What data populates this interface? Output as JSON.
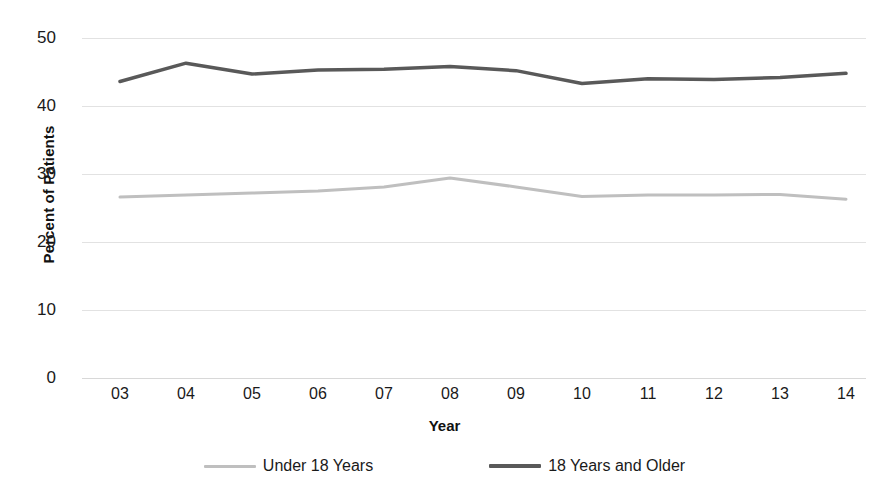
{
  "chart_data": {
    "type": "line",
    "title": "",
    "xlabel": "Year",
    "ylabel": "Percent of Patients",
    "categories": [
      "03",
      "04",
      "05",
      "06",
      "07",
      "08",
      "09",
      "10",
      "11",
      "12",
      "13",
      "14"
    ],
    "ylim": [
      0,
      50
    ],
    "yticks": [
      0,
      10,
      20,
      30,
      40,
      50
    ],
    "grid": true,
    "legend_position": "bottom",
    "series": [
      {
        "name": "Under 18 Years",
        "color": "#bfbfbf",
        "values": [
          26.6,
          26.9,
          27.2,
          27.5,
          28.1,
          29.4,
          28.1,
          26.7,
          26.9,
          26.9,
          27.0,
          26.3
        ]
      },
      {
        "name": "18 Years and Older",
        "color": "#595959",
        "values": [
          43.6,
          46.3,
          44.7,
          45.3,
          45.4,
          45.8,
          45.2,
          43.3,
          44.0,
          43.9,
          44.2,
          44.8
        ]
      }
    ]
  },
  "axes": {
    "y_title": "Percent of Patients",
    "x_title": "Year",
    "y_tick_labels": [
      "50",
      "40",
      "30",
      "20",
      "10",
      "0"
    ],
    "x_tick_labels": [
      "03",
      "04",
      "05",
      "06",
      "07",
      "08",
      "09",
      "10",
      "11",
      "12",
      "13",
      "14"
    ]
  },
  "legend": {
    "items": [
      {
        "label": "Under 18 Years",
        "color": "#bfbfbf"
      },
      {
        "label": "18 Years and Older",
        "color": "#595959"
      }
    ]
  }
}
